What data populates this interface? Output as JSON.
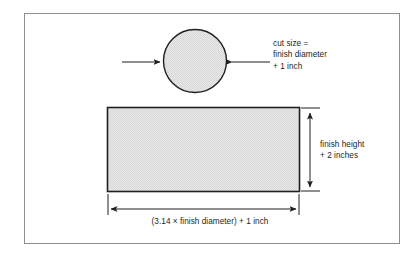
{
  "figure": {
    "frame": {
      "border_color": "#8e8e8e",
      "background": "#ffffff"
    },
    "shapes": {
      "circle": {
        "name": "circle-top-piece",
        "fill": "#e2e2e2",
        "stroke": "#231f20",
        "center_x": 195,
        "center_y": 61,
        "radius": 32
      },
      "rectangle": {
        "name": "rectangle-body-piece",
        "fill": "#e2e2e2",
        "stroke": "#231f20",
        "x": 107,
        "y": 107,
        "width": 193,
        "height": 85
      }
    },
    "annotations": {
      "cut_size": {
        "lines": [
          "cut size =",
          "finish diameter",
          "+ 1 inch"
        ]
      },
      "finish_height": {
        "lines": [
          "finish height",
          "+ 2 inches"
        ]
      },
      "width_caption": {
        "text": "(3.14 × finish diameter) + 1 inch"
      }
    },
    "arrows": {
      "diameter_left": {
        "name": "diameter-arrow-left",
        "direction": "right",
        "x1": 122,
        "y1": 62,
        "x2": 162,
        "y2": 62
      },
      "diameter_right": {
        "name": "diameter-arrow-right",
        "direction": "left",
        "x1": 270,
        "y1": 62,
        "x2": 230,
        "y2": 62
      },
      "height_dimension": {
        "name": "height-dimension-arrow",
        "direction": "both",
        "x": 310,
        "y1": 112,
        "y2": 188
      },
      "width_dimension": {
        "name": "width-dimension-arrow",
        "direction": "both",
        "y": 209,
        "x1": 110,
        "x2": 298
      }
    },
    "colors": {
      "line": "#231f20",
      "shape_fill": "#e2e2e2",
      "frame": "#8e8e8e",
      "text": "#231f20"
    }
  }
}
